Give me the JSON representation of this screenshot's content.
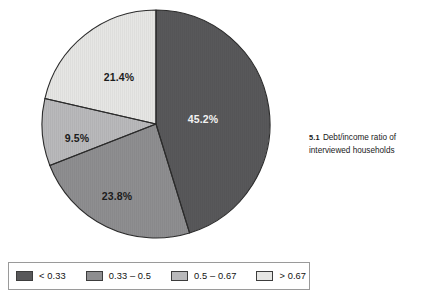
{
  "caption": {
    "number": "5.1",
    "text": "Debt/income ratio of interviewed households"
  },
  "chart_data": {
    "type": "pie",
    "title": "Debt/income ratio of interviewed households",
    "xlabel": "",
    "ylabel": "",
    "units": "percent",
    "start_angle_deg": 0,
    "direction": "clockwise",
    "legend_position": "bottom",
    "grid": false,
    "categories": [
      "< 0.33",
      "0.33 – 0.5",
      "0.5 – 0.67",
      "> 0.67"
    ],
    "values": [
      45.2,
      23.8,
      9.5,
      21.4
    ],
    "colors": [
      "#58585a",
      "#8e8e90",
      "#b9b9bb",
      "#e6e6e4"
    ],
    "slices": [
      {
        "label": "< 0.33",
        "value": 45.2,
        "display": "45.2%",
        "color": "#58585a",
        "label_color": "light",
        "label_x": 163,
        "label_y": 112
      },
      {
        "label": "0.33 – 0.5",
        "value": 23.8,
        "display": "23.8%",
        "color": "#8e8e90",
        "label_color": "dark",
        "label_x": 77,
        "label_y": 189
      },
      {
        "label": "0.5 – 0.67",
        "value": 9.5,
        "display": "9.5%",
        "color": "#b9b9bb",
        "label_color": "dark",
        "label_x": 37,
        "label_y": 131
      },
      {
        "label": "> 0.67",
        "value": 21.4,
        "display": "21.4%",
        "color": "#e6e6e4",
        "label_color": "dark",
        "label_x": 79,
        "label_y": 70
      }
    ]
  },
  "legend": {
    "items": [
      {
        "label": "< 0.33",
        "color": "#58585a"
      },
      {
        "label": "0.33 – 0.5",
        "color": "#8e8e90"
      },
      {
        "label": "0.5 – 0.67",
        "color": "#b9b9bb"
      },
      {
        "label": "> 0.67",
        "color": "#e6e6e4"
      }
    ]
  }
}
